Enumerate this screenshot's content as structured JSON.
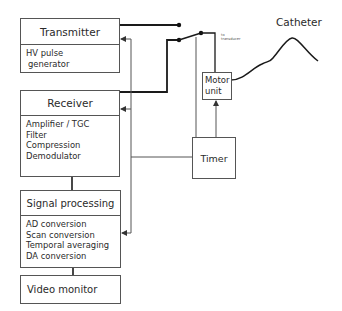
{
  "diagram": {
    "blocks": {
      "transmitter": {
        "title": "Transmitter",
        "items": [
          "HV pulse",
          " generator"
        ]
      },
      "receiver": {
        "title": "Receiver",
        "items": [
          "Amplifier / TGC",
          "Filter",
          "Compression",
          "Demodulator"
        ]
      },
      "signal_processing": {
        "title": "Signal processing",
        "items": [
          "AD conversion",
          "Scan conversion",
          "Temporal averaging",
          "DA conversion"
        ]
      },
      "video_monitor": {
        "title": "Video monitor"
      },
      "motor_unit": {
        "title_line1": "Motor",
        "title_line2": "unit"
      },
      "timer": {
        "title": "Timer"
      }
    },
    "labels": {
      "to_transducer_line1": "to",
      "to_transducer_line2": "transducer",
      "catheter": "Catheter"
    },
    "colors": {
      "line": "#1a1a1a",
      "thin_line": "#555555",
      "box_border": "#555555",
      "text": "#2a2a2a"
    }
  }
}
